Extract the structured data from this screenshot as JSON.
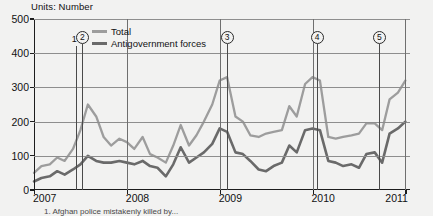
{
  "figure": {
    "units_title": "Units: Number",
    "footnote": "1. Afghan police mistakenly killed by..."
  },
  "legend": {
    "position": "top-center",
    "items": [
      {
        "label": "Total",
        "color": "#9d9d9d"
      },
      {
        "label": "Antigovernment forces",
        "color": "#6a6a6a"
      }
    ]
  },
  "annotations": [
    {
      "id": "1",
      "label": "1",
      "circled": false,
      "x_value": 2007.45
    },
    {
      "id": "2",
      "label": "2",
      "circled": true,
      "x_value": 2007.52
    },
    {
      "id": "3",
      "label": "3",
      "circled": true,
      "x_value": 2009.08
    },
    {
      "id": "4",
      "label": "4",
      "circled": true,
      "x_value": 2010.05
    },
    {
      "id": "5",
      "label": "5",
      "circled": true,
      "x_value": 2010.72
    }
  ],
  "chart_data": {
    "type": "line",
    "title": "Units: Number",
    "xlabel": "",
    "ylabel": "",
    "ylim": [
      0,
      500
    ],
    "yticks": [
      0,
      100,
      200,
      300,
      400,
      500
    ],
    "xticks": [
      2007,
      2008,
      2009,
      2010,
      2011
    ],
    "xlim": [
      2007,
      2011.05
    ],
    "grid": true,
    "legend_position": "top-center",
    "x": [
      2007.0,
      2007.08,
      2007.17,
      2007.25,
      2007.33,
      2007.42,
      2007.5,
      2007.58,
      2007.67,
      2007.75,
      2007.83,
      2007.92,
      2008.0,
      2008.08,
      2008.17,
      2008.25,
      2008.33,
      2008.42,
      2008.5,
      2008.58,
      2008.67,
      2008.75,
      2008.83,
      2008.92,
      2009.0,
      2009.08,
      2009.17,
      2009.25,
      2009.33,
      2009.42,
      2009.5,
      2009.58,
      2009.67,
      2009.75,
      2009.83,
      2009.92,
      2010.0,
      2010.08,
      2010.17,
      2010.25,
      2010.33,
      2010.42,
      2010.5,
      2010.58,
      2010.67,
      2010.75,
      2010.83,
      2010.92,
      2011.0
    ],
    "series": [
      {
        "name": "Total",
        "color": "#9d9d9d",
        "values": [
          50,
          70,
          75,
          95,
          85,
          120,
          175,
          250,
          215,
          155,
          130,
          150,
          140,
          120,
          155,
          105,
          95,
          80,
          130,
          190,
          130,
          160,
          200,
          250,
          320,
          330,
          215,
          200,
          160,
          155,
          165,
          170,
          175,
          245,
          215,
          310,
          330,
          320,
          155,
          150,
          155,
          160,
          165,
          195,
          195,
          175,
          265,
          285,
          320
        ]
      },
      {
        "name": "Antigovernment forces",
        "color": "#6a6a6a",
        "values": [
          25,
          35,
          40,
          55,
          45,
          60,
          75,
          100,
          85,
          80,
          80,
          85,
          80,
          75,
          85,
          70,
          65,
          40,
          75,
          125,
          80,
          95,
          110,
          135,
          180,
          170,
          110,
          105,
          85,
          60,
          55,
          70,
          80,
          130,
          110,
          175,
          180,
          175,
          85,
          80,
          70,
          75,
          65,
          105,
          110,
          80,
          165,
          180,
          200
        ]
      }
    ]
  }
}
